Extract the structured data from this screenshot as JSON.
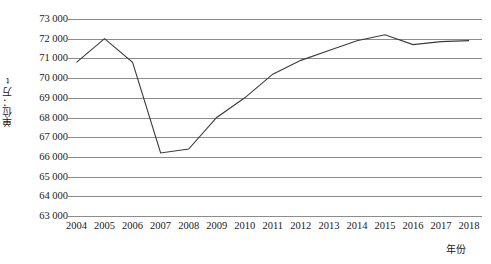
{
  "chart_data": {
    "type": "line",
    "title": "",
    "xlabel": "年份",
    "ylabel": "单位：万t",
    "x": [
      2004,
      2005,
      2006,
      2007,
      2008,
      2009,
      2010,
      2011,
      2012,
      2013,
      2014,
      2015,
      2016,
      2017,
      2018
    ],
    "categories": [
      "2004",
      "2005",
      "2006",
      "2007",
      "2008",
      "2009",
      "2010",
      "2011",
      "2012",
      "2013",
      "2014",
      "2015",
      "2016",
      "2017",
      "2018"
    ],
    "values": [
      70800,
      72000,
      70800,
      66200,
      66400,
      68000,
      69000,
      70200,
      70900,
      71400,
      71900,
      72200,
      71700,
      71850,
      71900
    ],
    "series": [
      {
        "name": "产量",
        "values": [
          70800,
          72000,
          70800,
          66200,
          66400,
          68000,
          69000,
          70200,
          70900,
          71400,
          71900,
          72200,
          71700,
          71850,
          71900
        ]
      }
    ],
    "ylim": [
      63000,
      73000
    ],
    "ytick_values": [
      73000,
      72000,
      71000,
      70000,
      69000,
      68000,
      67000,
      66000,
      65000,
      64000,
      63000
    ],
    "ytick_labels": [
      "73 000",
      "72 000",
      "71 000",
      "70 000",
      "69 000",
      "68 000",
      "67 000",
      "66 000",
      "65 000",
      "64 000",
      "63 000"
    ],
    "grid": true,
    "legend": "none",
    "line_color": "#3a3a3a",
    "grid_color": "#8c8c8c",
    "background": "#ffffff"
  }
}
